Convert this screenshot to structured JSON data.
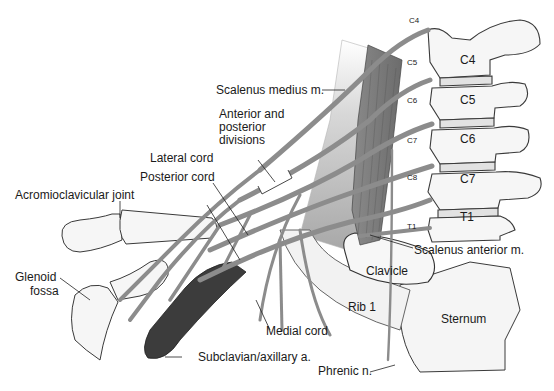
{
  "diagram": {
    "colors": {
      "bone_fill": "#f4f4f4",
      "bone_stroke": "#3a3a3a",
      "nerve": "#8c8c8c",
      "nerve_dark": "#5e5e5e",
      "artery": "#3c3c3c",
      "muscle": "#9a9a9a",
      "label_text": "#1a1a1a"
    },
    "labels": {
      "scalenus_medius": "Scalenus medius m.",
      "anterior_posterior_divisions_1": "Anterior and",
      "anterior_posterior_divisions_2": "posterior",
      "anterior_posterior_divisions_3": "divisions",
      "lateral_cord": "Lateral cord",
      "posterior_cord": "Posterior cord",
      "acromioclavicular_joint": "Acromioclavicular joint",
      "glenoid_fossa_1": "Glenoid",
      "glenoid_fossa_2": "fossa",
      "medial_cord": "Medial cord",
      "subclavian_axillary": "Subclavian/axillary a.",
      "phrenic": "Phrenic n.",
      "scalenus_anterior": "Scalenus anterior m.",
      "clavicle": "Clavicle",
      "rib1": "Rib 1",
      "sternum": "Sternum"
    },
    "vertebrae": [
      "C4",
      "C5",
      "C6",
      "C7",
      "T1"
    ],
    "nerve_roots": [
      "C4",
      "C5",
      "C6",
      "C7",
      "C8",
      "T1"
    ]
  }
}
